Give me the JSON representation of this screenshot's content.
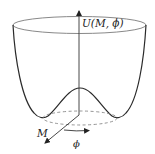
{
  "diagram": {
    "type": "mexican-hat-potential",
    "labels": {
      "potential_axis": "U(M, ϕ)",
      "radial_axis": "M",
      "angular_axis": "ϕ"
    },
    "colors": {
      "curve": "#2a2a2a",
      "rim": "#6a6a6a",
      "axis": "#333333",
      "dashed": "#7a7a7a",
      "background": "#ffffff"
    }
  }
}
